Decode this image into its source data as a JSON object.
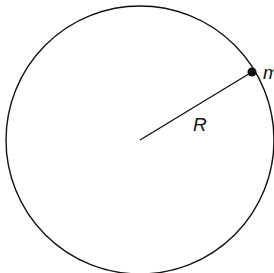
{
  "diagram": {
    "radius_label": "R",
    "mass_label": "m",
    "colors": {
      "stroke": "#111111",
      "background": "#ffffff"
    },
    "circle": {
      "cx": 140,
      "cy": 140,
      "r": 134
    },
    "mass_point": {
      "x": 252,
      "y": 72
    }
  }
}
